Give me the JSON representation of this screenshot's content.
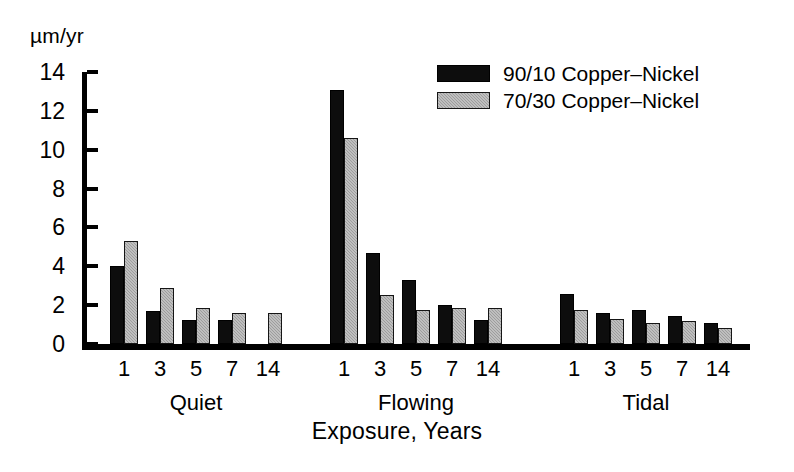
{
  "chart_data": {
    "type": "bar",
    "title": "",
    "subtitle": "",
    "xlabel": "Exposure, Years",
    "ylabel": "µm/yr",
    "ylim": [
      0,
      14
    ],
    "yticks": [
      0,
      2,
      4,
      6,
      8,
      10,
      12,
      14
    ],
    "ytick_labels": [
      "0",
      "2",
      "4",
      "6",
      "8",
      "10",
      "12",
      "14"
    ],
    "grid": false,
    "legend_position": "upper right",
    "categories": [
      "1",
      "3",
      "5",
      "7",
      "14"
    ],
    "group_labels": [
      "Quiet",
      "Flowing",
      "Tidal"
    ],
    "series": [
      {
        "name": "90/10 Copper-Nickel",
        "color": "#0d0d0d",
        "groups": {
          "Quiet": [
            4.0,
            1.7,
            1.25,
            1.25,
            0
          ],
          "Flowing": [
            13.1,
            4.7,
            3.3,
            2.0,
            1.25
          ],
          "Tidal": [
            2.55,
            1.6,
            1.75,
            1.45,
            1.1
          ]
        }
      },
      {
        "name": "70/30 Copper-Nickel",
        "color": "#9d9d9d",
        "groups": {
          "Quiet": [
            5.3,
            2.9,
            1.85,
            1.6,
            1.6
          ],
          "Flowing": [
            10.6,
            2.5,
            1.75,
            1.85,
            1.85
          ],
          "Tidal": [
            1.75,
            1.3,
            1.1,
            1.2,
            0.85
          ]
        }
      }
    ],
    "annotations": []
  },
  "legend": {
    "items": [
      {
        "label": "90/10 Copper–Nickel",
        "swatch": "black"
      },
      {
        "label": "70/30 Copper–Nickel",
        "swatch": "gray"
      }
    ]
  },
  "axis": {
    "unit_label": "µm/yr",
    "x_title": "Exposure, Years"
  }
}
